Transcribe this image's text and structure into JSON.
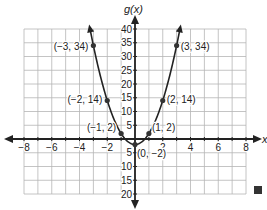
{
  "chart_data": {
    "type": "line",
    "title": "",
    "xlabel": "x",
    "ylabel": "g(x)",
    "xlim": [
      -8,
      8
    ],
    "ylim": [
      -20,
      40
    ],
    "grid": true,
    "x_ticks": [
      -8,
      -6,
      -4,
      -2,
      2,
      4,
      6,
      8
    ],
    "y_ticks": [
      -20,
      -15,
      -10,
      -5,
      5,
      10,
      15,
      20,
      25,
      30,
      35,
      40
    ],
    "series": [
      {
        "name": "g(x)",
        "function": "4x^2 - 2",
        "points": [
          {
            "x": -3,
            "y": 34,
            "label": "(−3, 34)"
          },
          {
            "x": -2,
            "y": 14,
            "label": "(−2, 14)"
          },
          {
            "x": -1,
            "y": 2,
            "label": "(−1, 2)"
          },
          {
            "x": 0,
            "y": -2,
            "label": "(0, −2)"
          },
          {
            "x": 1,
            "y": 2,
            "label": "(1, 2)"
          },
          {
            "x": 2,
            "y": 14,
            "label": "(2, 14)"
          },
          {
            "x": 3,
            "y": 34,
            "label": "(3, 34)"
          }
        ]
      }
    ],
    "end_marker": "filled-square"
  },
  "colors": {
    "grid": "#b5b5b5",
    "axis": "#222222",
    "curve": "#222222",
    "marker": "#333333"
  }
}
